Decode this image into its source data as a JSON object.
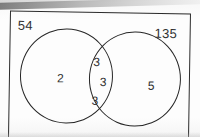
{
  "diagram": {
    "type": "venn-two-set",
    "frame_label": "rectangle-universal-set",
    "universe_labels": {
      "left": "54",
      "right": "135"
    },
    "regions": [
      {
        "id": "left-only",
        "label": "2"
      },
      {
        "id": "intersection-top",
        "label": "3"
      },
      {
        "id": "intersection-middle",
        "label": "3"
      },
      {
        "id": "intersection-bottom",
        "label": "3"
      },
      {
        "id": "right-only",
        "label": "5"
      }
    ],
    "colors": {
      "stroke": "#262626",
      "frame_stroke": "#2b2b2b",
      "text": "#313131",
      "paper": "#fdfdfd",
      "scan_band": "#8d8d8d"
    }
  }
}
